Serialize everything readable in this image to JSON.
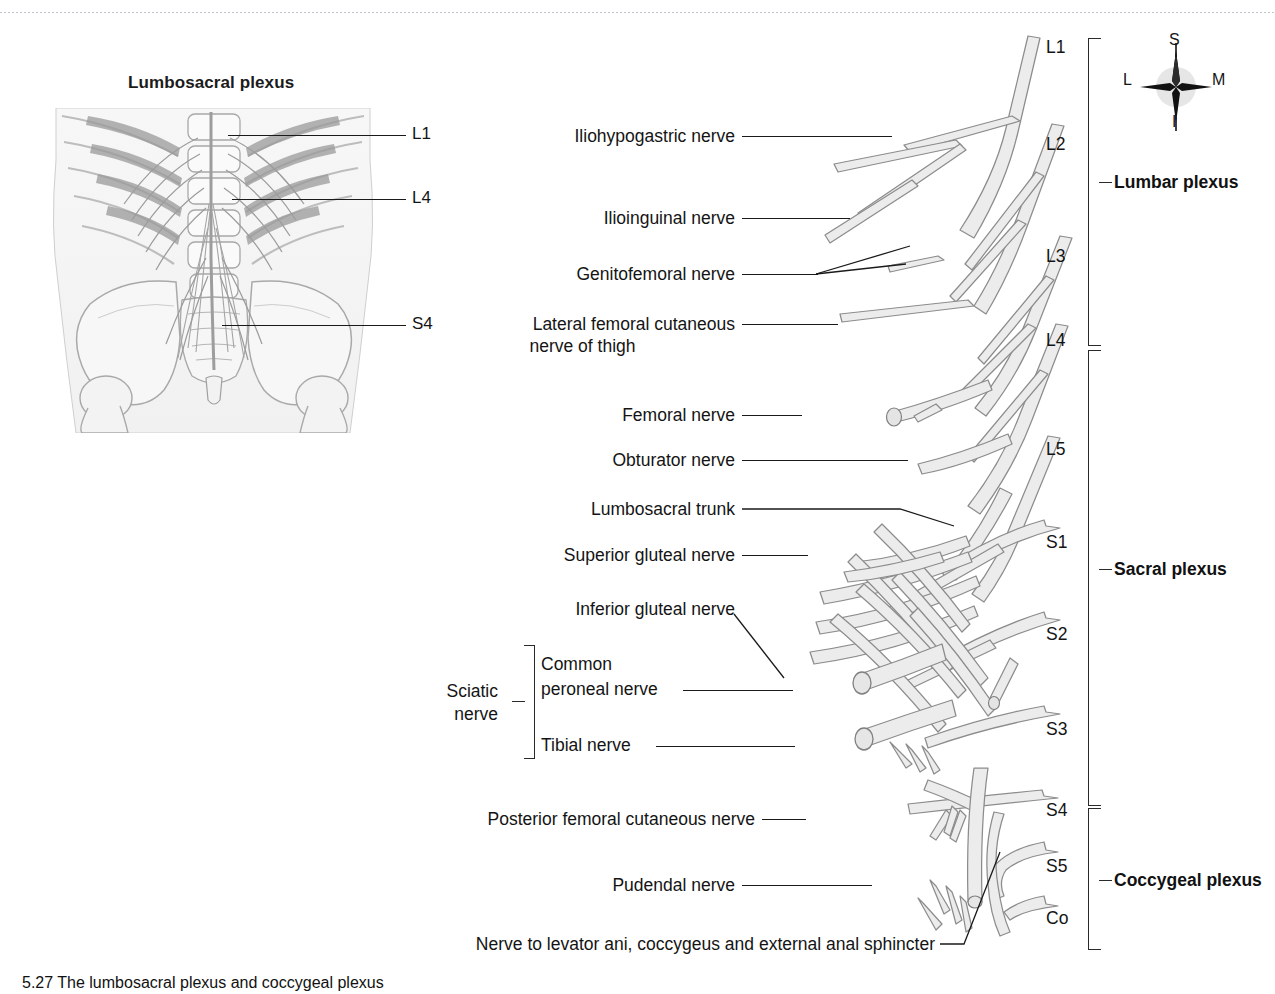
{
  "figure": {
    "inset_title": "Lumbosacral plexus",
    "caption": "5.27 The lumbosacral plexus and coccygeal plexus"
  },
  "inset": {
    "labels": [
      {
        "text": "L1",
        "y": 134
      },
      {
        "text": "L4",
        "y": 198
      },
      {
        "text": "S4",
        "y": 324
      }
    ]
  },
  "compass": {
    "superior": "S",
    "inferior": "I",
    "lateral": "L",
    "medial": "M"
  },
  "nerve_labels": [
    {
      "id": "iliohypogastric",
      "text": "Iliohypogastric nerve"
    },
    {
      "id": "ilioinguinal",
      "text": "Ilioinguinal nerve"
    },
    {
      "id": "genitofemoral",
      "text": "Genitofemoral nerve"
    },
    {
      "id": "lfcn_line1",
      "text": "Lateral femoral cutaneous"
    },
    {
      "id": "lfcn_line2",
      "text": "nerve of thigh"
    },
    {
      "id": "femoral",
      "text": "Femoral nerve"
    },
    {
      "id": "obturator",
      "text": "Obturator nerve"
    },
    {
      "id": "lumbosacral_trunk",
      "text": "Lumbosacral trunk"
    },
    {
      "id": "superior_gluteal",
      "text": "Superior gluteal nerve"
    },
    {
      "id": "inferior_gluteal",
      "text": "Inferior gluteal nerve"
    },
    {
      "id": "common_peroneal_l1",
      "text": "Common"
    },
    {
      "id": "common_peroneal_l2",
      "text": "peroneal nerve"
    },
    {
      "id": "tibial",
      "text": "Tibial nerve"
    },
    {
      "id": "sciatic_l1",
      "text": "Sciatic"
    },
    {
      "id": "sciatic_l2",
      "text": "nerve"
    },
    {
      "id": "pfcn",
      "text": "Posterior femoral cutaneous nerve"
    },
    {
      "id": "pudendal",
      "text": "Pudendal nerve"
    },
    {
      "id": "levator_ani",
      "text": "Nerve to levator ani, coccygeus and external anal sphincter"
    }
  ],
  "spinal_levels": [
    {
      "text": "L1",
      "y": 37
    },
    {
      "text": "L2",
      "y": 134
    },
    {
      "text": "L3",
      "y": 246
    },
    {
      "text": "L4",
      "y": 330
    },
    {
      "text": "L5",
      "y": 439
    },
    {
      "text": "S1",
      "y": 532
    },
    {
      "text": "S2",
      "y": 624
    },
    {
      "text": "S3",
      "y": 719
    },
    {
      "text": "S4",
      "y": 800
    },
    {
      "text": "S5",
      "y": 856
    },
    {
      "text": "Co",
      "y": 908
    }
  ],
  "plexus_groups": [
    {
      "text": "Lumbar plexus",
      "y": 174
    },
    {
      "text": "Sacral plexus",
      "y": 561
    },
    {
      "text": "Coccygeal plexus",
      "y": 873
    }
  ],
  "colors": {
    "nerve_fill": "#ececec",
    "nerve_stroke": "#8c8c8c",
    "leader": "#1a1a1a",
    "text": "#141414",
    "inset_tint": "#f4f4f4"
  }
}
